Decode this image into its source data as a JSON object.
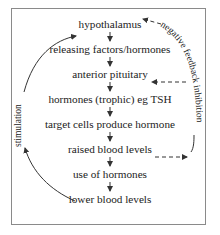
{
  "diagram": {
    "nodes": [
      {
        "id": "hypothalamus",
        "label": "hypothalamus"
      },
      {
        "id": "releasing",
        "label": "releasing factors/hormones"
      },
      {
        "id": "anterior",
        "label": "anterior pituitary"
      },
      {
        "id": "trophic",
        "label": "hormones (trophic) eg TSH"
      },
      {
        "id": "target",
        "label": "target cells produce hormone"
      },
      {
        "id": "raised",
        "label": "raised blood levels"
      },
      {
        "id": "use",
        "label": "use of hormones"
      },
      {
        "id": "lower",
        "label": "lower blood levels"
      }
    ],
    "side_labels": {
      "left": "stimulation",
      "right": "negative feedback inhibition"
    },
    "colors": {
      "text": "#222222",
      "border": "#8a8a8a",
      "arrow": "#333333"
    }
  }
}
